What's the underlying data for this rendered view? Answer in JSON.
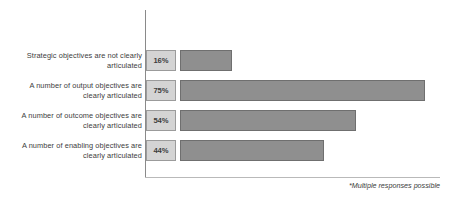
{
  "chart_data": {
    "type": "bar",
    "orientation": "horizontal",
    "title": "",
    "subtitle": "",
    "xlabel": "",
    "ylabel": "",
    "xlim": [
      0,
      100
    ],
    "grid": false,
    "legend": null,
    "unit": "%",
    "categories": [
      "Strategic objectives are not clearly articulated",
      "A number of output objectives are clearly articulated",
      "A number of outcome objectives are clearly articulated",
      "A number of enabling objectives are clearly articulated"
    ],
    "values": [
      16,
      75,
      54,
      44
    ],
    "value_labels": [
      "16%",
      "75%",
      "54%",
      "44%"
    ],
    "annotations": [
      "*Multiple responses possible"
    ],
    "colors": {
      "bar_fill": "#8f8f8f",
      "bar_stroke": "#6f6f6f",
      "value_box_fill": "#d4d4d4",
      "value_box_stroke": "#9b9b9b",
      "axis": "#8a8a8a",
      "text": "#3d3d3d",
      "background": "#ffffff"
    }
  },
  "rows": [
    {
      "label_line1": "Strategic objectives are not clearly",
      "label_line2": "articulated",
      "value_label": "16%"
    },
    {
      "label_line1": "A number of output objectives are",
      "label_line2": "clearly articulated",
      "value_label": "75%"
    },
    {
      "label_line1": "A number of outcome objectives are",
      "label_line2": "clearly articulated",
      "value_label": "54%"
    },
    {
      "label_line1": "A number of enabling objectives are",
      "label_line2": "clearly articulated",
      "value_label": "44%"
    }
  ],
  "footnote": "*Multiple responses possible"
}
